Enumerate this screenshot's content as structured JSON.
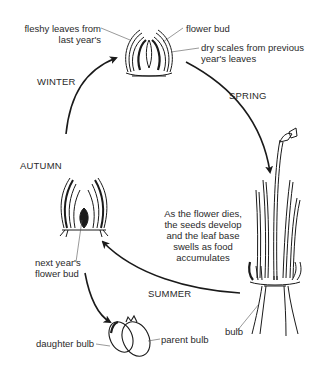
{
  "diagram": {
    "type": "life-cycle",
    "seasons": [
      "SPRING",
      "SUMMER",
      "AUTUMN",
      "WINTER"
    ],
    "labels": {
      "fleshy_leaves_line1": "fleshy leaves from",
      "fleshy_leaves_line2": "last year's",
      "flower_bud": "flower bud",
      "dry_scales_line1": "dry scales from previous",
      "dry_scales_line2": "year's leaves",
      "summer_note_line1": "As the flower dies,",
      "summer_note_line2": "the seeds develop",
      "summer_note_line3": "and the leaf base",
      "summer_note_line4": "swells as food",
      "summer_note_line5": "accumulates",
      "next_bud_line1": "next year's",
      "next_bud_line2": "flower bud",
      "bulb": "bulb",
      "daughter_bulb": "daughter bulb",
      "parent_bulb": "parent bulb"
    },
    "stages": [
      {
        "name": "winter-bud",
        "position": "top"
      },
      {
        "name": "flowering-plant",
        "position": "right"
      },
      {
        "name": "autumn-bulb",
        "position": "left"
      },
      {
        "name": "dividing-bulbs",
        "position": "bottom"
      }
    ],
    "line_color": "#1a1a1a"
  }
}
